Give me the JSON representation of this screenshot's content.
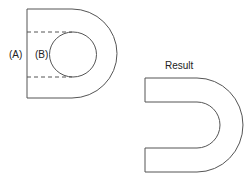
{
  "diagram": {
    "labels": {
      "a": "(A)",
      "b": "(B)",
      "result": "Result"
    },
    "colors": {
      "stroke": "#555555",
      "background": "#ffffff"
    },
    "parts": [
      {
        "id": "a",
        "description": "D-shaped outer solid with straight left edge and semicircular right end"
      },
      {
        "id": "b",
        "description": "Circular region extended to the left edge by dashed lines (slot to subtract)"
      },
      {
        "id": "result",
        "description": "U-shaped solid resulting from subtracting B from A"
      }
    ]
  }
}
